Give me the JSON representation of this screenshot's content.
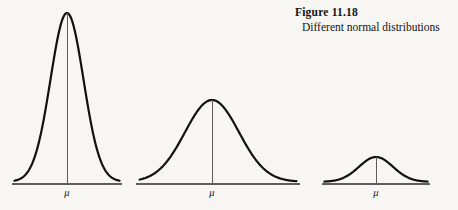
{
  "figure": {
    "caption_title": "Figure 11.18",
    "caption_subtitle": "Different normal distributions",
    "background_color": "#f7f6f2",
    "curve_color": "#111111",
    "axis_color": "#5d5d5d"
  },
  "chart_data": {
    "type": "line",
    "title": "Figure 11.18",
    "subtitle": "Different normal distributions",
    "xlabel": "",
    "ylabel": "",
    "grid": false,
    "legend": null,
    "annotations": [
      "μ",
      "μ",
      "μ"
    ],
    "series": [
      {
        "name": "narrow-tall-normal",
        "mean_label": "μ",
        "baseline_x": [
          12,
          122
        ],
        "center_x": 67,
        "baseline_y": 184,
        "peak_y": 13,
        "peak_height": 171,
        "sigma_px": 16.5,
        "relative_sigma": "small",
        "relative_peak": "tall"
      },
      {
        "name": "medium-normal",
        "mean_label": "μ",
        "baseline_x": [
          136,
          300
        ],
        "center_x": 212,
        "baseline_y": 184,
        "peak_y": 100,
        "peak_height": 84,
        "sigma_px": 27,
        "relative_sigma": "medium",
        "relative_peak": "medium"
      },
      {
        "name": "wide-flat-normal",
        "mean_label": "μ",
        "baseline_x": [
          322,
          430
        ],
        "center_x": 376,
        "baseline_y": 184,
        "peak_y": 157,
        "peak_height": 27,
        "sigma_px": 17,
        "relative_sigma": "large",
        "relative_peak": "short"
      }
    ]
  }
}
